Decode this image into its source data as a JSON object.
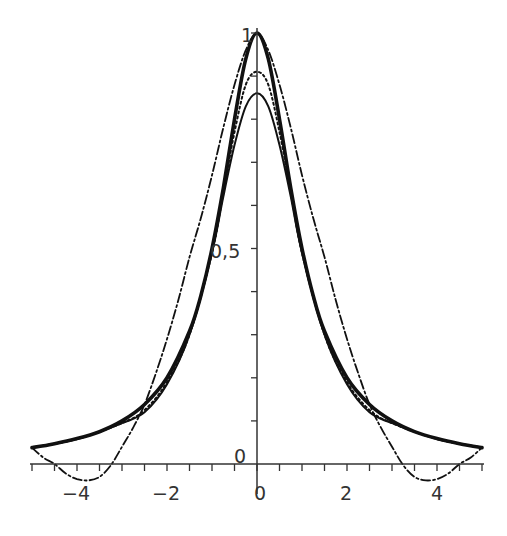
{
  "chart_data": {
    "type": "line",
    "title": "",
    "xlabel": "",
    "ylabel": "",
    "xlim": [
      -5,
      5
    ],
    "ylim": [
      -0.08,
      1.0
    ],
    "grid": false,
    "legend": null,
    "x_ticks": {
      "major": [
        -4,
        -2,
        0,
        2,
        4
      ],
      "labels": [
        "-4",
        "-2",
        "0",
        "2",
        "4"
      ],
      "minor_step": 0.5
    },
    "y_ticks": {
      "major": [
        0,
        0.5,
        1
      ],
      "labels": [
        "0",
        "0,5",
        "1"
      ],
      "minor_step": 0.1
    },
    "series": [
      {
        "name": "exact",
        "style": "thick-solid",
        "x": [
          -5,
          -4.5,
          -4,
          -3.5,
          -3,
          -2.5,
          -2,
          -1.5,
          -1.25,
          -1,
          -0.75,
          -0.5,
          -0.25,
          0,
          0.25,
          0.5,
          0.75,
          1,
          1.25,
          1.5,
          2,
          2.5,
          3,
          3.5,
          4,
          4.5,
          5
        ],
        "y": [
          0.038,
          0.047,
          0.059,
          0.075,
          0.1,
          0.138,
          0.2,
          0.308,
          0.39,
          0.5,
          0.64,
          0.8,
          0.94,
          1.0,
          0.94,
          0.8,
          0.64,
          0.5,
          0.39,
          0.308,
          0.2,
          0.138,
          0.1,
          0.075,
          0.059,
          0.047,
          0.038
        ]
      },
      {
        "name": "approx-wide",
        "style": "dash-dot",
        "x": [
          -5,
          -4.75,
          -4.5,
          -4.25,
          -4,
          -3.75,
          -3.5,
          -3.25,
          -3,
          -2.75,
          -2.5,
          -2.25,
          -2,
          -1.75,
          -1.5,
          -1.25,
          -1,
          -0.75,
          -0.5,
          -0.25,
          0,
          0.25,
          0.5,
          0.75,
          1,
          1.25,
          1.5,
          1.75,
          2,
          2.25,
          2.5,
          2.75,
          3,
          3.25,
          3.5,
          3.75,
          4,
          4.25,
          4.5,
          4.75,
          5
        ],
        "y": [
          0.038,
          0.015,
          0.0,
          -0.022,
          -0.035,
          -0.038,
          -0.03,
          -0.003,
          0.04,
          0.085,
          0.138,
          0.21,
          0.29,
          0.38,
          0.48,
          0.57,
          0.67,
          0.78,
          0.88,
          0.96,
          1.0,
          0.96,
          0.88,
          0.78,
          0.67,
          0.57,
          0.48,
          0.38,
          0.29,
          0.21,
          0.138,
          0.085,
          0.04,
          -0.003,
          -0.03,
          -0.038,
          -0.035,
          -0.022,
          0.0,
          0.015,
          0.038
        ]
      },
      {
        "name": "approx-dotted",
        "style": "dotted",
        "x": [
          -5,
          -4,
          -3,
          -2.5,
          -2,
          -1.5,
          -1,
          -0.75,
          -0.5,
          -0.25,
          0,
          0.25,
          0.5,
          0.75,
          1,
          1.5,
          2,
          2.5,
          3,
          4,
          5
        ],
        "y": [
          0.038,
          0.058,
          0.095,
          0.125,
          0.19,
          0.3,
          0.49,
          0.63,
          0.77,
          0.88,
          0.91,
          0.88,
          0.77,
          0.63,
          0.49,
          0.3,
          0.19,
          0.125,
          0.095,
          0.058,
          0.038
        ]
      },
      {
        "name": "approx-thin",
        "style": "thin-solid",
        "x": [
          -5,
          -4,
          -3,
          -2.5,
          -2,
          -1.5,
          -1,
          -0.75,
          -0.5,
          -0.25,
          0,
          0.25,
          0.5,
          0.75,
          1,
          1.5,
          2,
          2.5,
          3,
          4,
          5
        ],
        "y": [
          0.038,
          0.058,
          0.095,
          0.12,
          0.185,
          0.3,
          0.49,
          0.62,
          0.74,
          0.83,
          0.86,
          0.83,
          0.74,
          0.62,
          0.49,
          0.3,
          0.185,
          0.12,
          0.095,
          0.058,
          0.038
        ]
      }
    ]
  },
  "axes": {
    "x_tick_labels": [
      "-4",
      "-2",
      "0",
      "2",
      "4"
    ],
    "y_tick_labels": [
      "0",
      "0,5",
      "1"
    ]
  }
}
